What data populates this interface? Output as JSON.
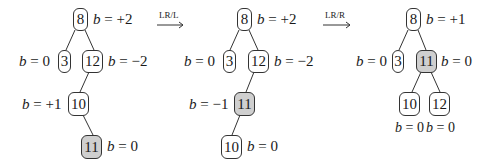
{
  "diagram": {
    "steps": [
      {
        "name": "initial",
        "nodes": [
          {
            "id": "8",
            "label": "8",
            "balance": "b = +2",
            "highlight": false
          },
          {
            "id": "3",
            "label": "3",
            "balance": "b = 0",
            "highlight": false
          },
          {
            "id": "12",
            "label": "12",
            "balance": "b = −2",
            "highlight": false
          },
          {
            "id": "10",
            "label": "10",
            "balance": "b = +1",
            "highlight": false
          },
          {
            "id": "11",
            "label": "11",
            "balance": "b = 0",
            "highlight": true
          }
        ],
        "edges": [
          [
            "8",
            "3"
          ],
          [
            "8",
            "12"
          ],
          [
            "12",
            "10"
          ],
          [
            "10",
            "11"
          ]
        ]
      },
      {
        "name": "after-LR/L",
        "nodes": [
          {
            "id": "8",
            "label": "8",
            "balance": "b = +2",
            "highlight": false
          },
          {
            "id": "3",
            "label": "3",
            "balance": "b = 0",
            "highlight": false
          },
          {
            "id": "12",
            "label": "12",
            "balance": "b = −2",
            "highlight": false
          },
          {
            "id": "11",
            "label": "11",
            "balance": "b = −1",
            "highlight": true
          },
          {
            "id": "10",
            "label": "10",
            "balance": "b = 0",
            "highlight": false
          }
        ],
        "edges": [
          [
            "8",
            "3"
          ],
          [
            "8",
            "12"
          ],
          [
            "12",
            "11"
          ],
          [
            "11",
            "10"
          ]
        ]
      },
      {
        "name": "after-LR/R",
        "nodes": [
          {
            "id": "8",
            "label": "8",
            "balance": "b = +1",
            "highlight": false
          },
          {
            "id": "3",
            "label": "3",
            "balance": "b = 0",
            "highlight": false
          },
          {
            "id": "11",
            "label": "11",
            "balance": "b = 0",
            "highlight": true
          },
          {
            "id": "10",
            "label": "10",
            "balance": "b = 0",
            "highlight": false
          },
          {
            "id": "12",
            "label": "12",
            "balance": "b = 0",
            "highlight": false
          }
        ],
        "edges": [
          [
            "8",
            "3"
          ],
          [
            "8",
            "11"
          ],
          [
            "11",
            "10"
          ],
          [
            "11",
            "12"
          ]
        ]
      }
    ],
    "arrows": [
      {
        "label": "LR/L"
      },
      {
        "label": "LR/R"
      }
    ],
    "colors": {
      "highlight": "#cfcfcf",
      "stroke": "#333333"
    }
  }
}
